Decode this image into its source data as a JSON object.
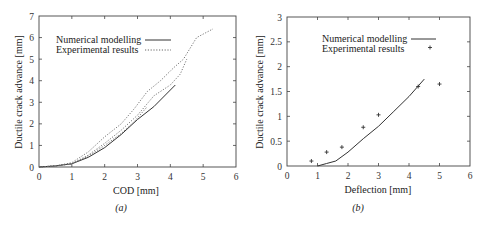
{
  "chart_data": [
    {
      "type": "line",
      "caption": "(a)",
      "title": "",
      "xlabel": "COD [mm]",
      "ylabel": "Ductile crack advance [mm]",
      "xlim": [
        0,
        6
      ],
      "ylim": [
        0,
        7
      ],
      "xticks": [
        0,
        1,
        2,
        3,
        4,
        5,
        6
      ],
      "yticks": [
        0,
        1,
        2,
        3,
        4,
        5,
        6,
        7
      ],
      "grid": false,
      "legend_position": "upper left (inside)",
      "series": [
        {
          "name": "Numerical modelling",
          "style": "solid",
          "x": [
            0,
            0.5,
            1.0,
            1.5,
            2.0,
            2.5,
            3.0,
            3.5,
            4.15
          ],
          "y": [
            0,
            0.05,
            0.15,
            0.45,
            0.9,
            1.5,
            2.2,
            2.8,
            3.8
          ]
        },
        {
          "name": "Experimental results",
          "style": "dotted",
          "x": [
            0,
            0.5,
            1.0,
            1.5,
            2.0,
            2.5,
            2.9,
            3.3,
            3.7,
            4.1,
            4.4,
            4.8,
            5.3
          ],
          "y": [
            0,
            0.05,
            0.2,
            0.7,
            1.4,
            2.0,
            2.7,
            3.5,
            4.0,
            4.6,
            5.0,
            6.0,
            6.4
          ]
        },
        {
          "name": "Experimental results",
          "style": "dotted",
          "x": [
            0,
            0.5,
            1.0,
            1.5,
            2.0,
            2.5,
            3.0,
            3.5,
            4.0,
            4.3,
            4.5
          ],
          "y": [
            0,
            0.05,
            0.15,
            0.55,
            1.1,
            1.7,
            2.4,
            3.3,
            3.8,
            4.3,
            5.0
          ]
        },
        {
          "name": "Experimental results",
          "style": "dotted",
          "x": [
            0,
            0.5,
            1.0,
            1.5,
            2.0,
            2.5,
            2.9,
            3.3
          ],
          "y": [
            0,
            0.05,
            0.15,
            0.5,
            1.0,
            1.55,
            2.1,
            2.8
          ]
        }
      ]
    },
    {
      "type": "line",
      "caption": "(b)",
      "title": "",
      "xlabel": "Deflection [mm]",
      "ylabel": "Ductile crack advance [mm]",
      "xlim": [
        0,
        6
      ],
      "ylim": [
        0,
        3
      ],
      "xticks": [
        0,
        1,
        2,
        3,
        4,
        5,
        6
      ],
      "yticks": [
        0,
        0.5,
        1,
        1.5,
        2,
        2.5,
        3
      ],
      "grid": false,
      "legend_position": "upper left (inside)",
      "series": [
        {
          "name": "Numerical modelling",
          "style": "solid",
          "x": [
            1.0,
            1.3,
            1.6,
            2.0,
            2.5,
            3.0,
            3.5,
            4.0,
            4.5
          ],
          "y": [
            0,
            0.05,
            0.1,
            0.28,
            0.55,
            0.8,
            1.1,
            1.4,
            1.75
          ]
        },
        {
          "name": "Experimental results",
          "style": "points",
          "marker": "+",
          "x": [
            0.8,
            1.3,
            1.8,
            2.5,
            3.0,
            4.3,
            5.0
          ],
          "y": [
            0.1,
            0.28,
            0.38,
            0.78,
            1.03,
            1.6,
            1.65
          ]
        }
      ]
    }
  ],
  "charts": {
    "a": {
      "caption": "(a)",
      "xlabel": "COD [mm]",
      "ylabel": "Ductile crack advance [mm]",
      "legend": [
        "Numerical modelling",
        "Experimental results"
      ]
    },
    "b": {
      "caption": "(b)",
      "xlabel": "Deflection [mm]",
      "ylabel": "Ductile crack advance [mm]",
      "legend": [
        "Numerical modelling",
        "Experimental results"
      ]
    }
  },
  "colors": {
    "line": "#333333",
    "axis": "#444444"
  }
}
